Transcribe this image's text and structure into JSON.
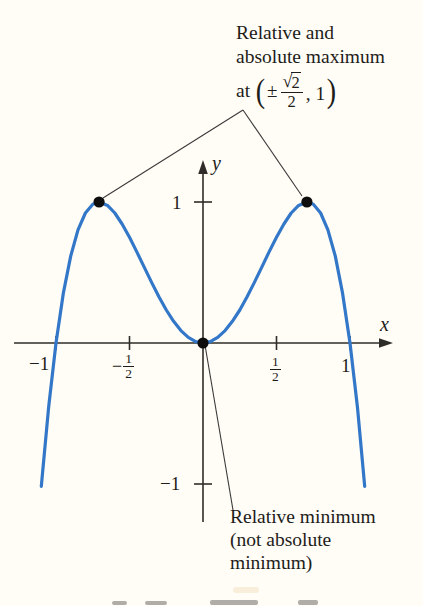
{
  "figure": {
    "background": "#fffdf6",
    "curve_color": "#3377c9",
    "axis_color": "#2e2c29",
    "point_color": "#0d0d0d",
    "leader_color": "#3a3a3a",
    "axis_labels": {
      "x": "x",
      "y": "y"
    },
    "tick_labels": {
      "y_pos1": "1",
      "y_neg1": "−1",
      "x_neg1": "−1",
      "x_pos1": "1",
      "x_neg_half": {
        "sign": "−",
        "num": "1",
        "den": "2"
      },
      "x_pos_half": {
        "num": "1",
        "den": "2"
      }
    },
    "max_annotation": {
      "line1": "Relative and",
      "line2": "absolute maximum",
      "at": "at",
      "lparen": "(",
      "plus_minus": "±",
      "sqrt_sign": "√",
      "radicand": "2",
      "denominator": "2",
      "comma_value": ", 1",
      "rparen": ")"
    },
    "min_annotation": {
      "line1": "Relative minimum",
      "line2": "(not absolute",
      "line3": "minimum)"
    }
  },
  "chart_data": {
    "type": "line",
    "title": "",
    "xlabel": "x",
    "ylabel": "y",
    "xlim": [
      -1.3,
      1.3
    ],
    "ylim": [
      -1.3,
      1.3
    ],
    "grid": false,
    "x_ticks": [
      -1,
      -0.5,
      0.5,
      1
    ],
    "y_ticks": [
      1,
      -1
    ],
    "series": [
      {
        "name": "f",
        "points": [
          [
            -1.1,
            -1.016
          ],
          [
            -1.05,
            -0.452
          ],
          [
            -1.0,
            0.0
          ],
          [
            -0.95,
            0.352
          ],
          [
            -0.9,
            0.616
          ],
          [
            -0.85,
            0.802
          ],
          [
            -0.8,
            0.922
          ],
          [
            -0.75,
            0.984
          ],
          [
            -0.707,
            1.0
          ],
          [
            -0.65,
            0.976
          ],
          [
            -0.6,
            0.922
          ],
          [
            -0.55,
            0.844
          ],
          [
            -0.5,
            0.75
          ],
          [
            -0.45,
            0.646
          ],
          [
            -0.4,
            0.538
          ],
          [
            -0.35,
            0.43
          ],
          [
            -0.3,
            0.328
          ],
          [
            -0.25,
            0.234
          ],
          [
            -0.2,
            0.154
          ],
          [
            -0.15,
            0.088
          ],
          [
            -0.1,
            0.04
          ],
          [
            -0.05,
            0.01
          ],
          [
            0.0,
            0.0
          ],
          [
            0.05,
            0.01
          ],
          [
            0.1,
            0.04
          ],
          [
            0.15,
            0.088
          ],
          [
            0.2,
            0.154
          ],
          [
            0.25,
            0.234
          ],
          [
            0.3,
            0.328
          ],
          [
            0.35,
            0.43
          ],
          [
            0.4,
            0.538
          ],
          [
            0.45,
            0.646
          ],
          [
            0.5,
            0.75
          ],
          [
            0.55,
            0.844
          ],
          [
            0.6,
            0.922
          ],
          [
            0.65,
            0.976
          ],
          [
            0.707,
            1.0
          ],
          [
            0.75,
            0.984
          ],
          [
            0.8,
            0.922
          ],
          [
            0.85,
            0.802
          ],
          [
            0.9,
            0.616
          ],
          [
            0.95,
            0.352
          ],
          [
            1.0,
            0.0
          ],
          [
            1.05,
            -0.452
          ],
          [
            1.1,
            -1.016
          ]
        ]
      }
    ],
    "key_points": [
      {
        "x": -0.707,
        "y": 1,
        "name": "left-maximum-point",
        "label": "Relative and absolute maximum at (−√2/2, 1)"
      },
      {
        "x": 0.707,
        "y": 1,
        "name": "right-maximum-point",
        "label": "Relative and absolute maximum at (√2/2, 1)"
      },
      {
        "x": 0,
        "y": 0,
        "name": "minimum-point",
        "label": "Relative minimum (not absolute minimum)"
      }
    ]
  }
}
